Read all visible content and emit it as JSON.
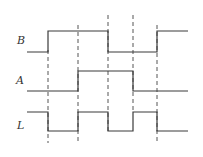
{
  "diagram": {
    "type": "timing-diagram",
    "signals": [
      {
        "name": "B",
        "label": "B",
        "waveform": "0 1 1 0 0 1"
      },
      {
        "name": "A",
        "label": "A",
        "waveform": "0 0 1 1 0 0"
      },
      {
        "name": "L",
        "label": "L",
        "waveform": "1 0 1 0 1 0"
      }
    ],
    "transition_markers": 5,
    "colors": {
      "stroke": "#3a3a3a",
      "dash": "#555555",
      "background": "#ffffff"
    }
  }
}
